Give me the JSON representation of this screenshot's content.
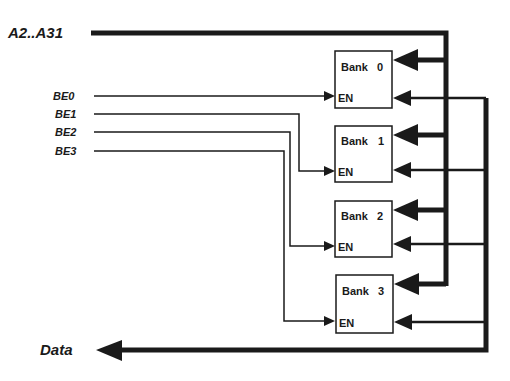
{
  "diagram": {
    "address_bus_label": "A2..A31",
    "data_bus_label": "Data",
    "byte_enables": [
      "BE0",
      "BE1",
      "BE2",
      "BE3"
    ],
    "banks": [
      {
        "name": "Bank",
        "index": "0",
        "enable_label": "EN"
      },
      {
        "name": "Bank",
        "index": "1",
        "enable_label": "EN"
      },
      {
        "name": "Bank",
        "index": "2",
        "enable_label": "EN"
      },
      {
        "name": "Bank",
        "index": "3",
        "enable_label": "EN"
      }
    ],
    "colors": {
      "ink": "#1a1a1a",
      "background": "#ffffff"
    }
  }
}
